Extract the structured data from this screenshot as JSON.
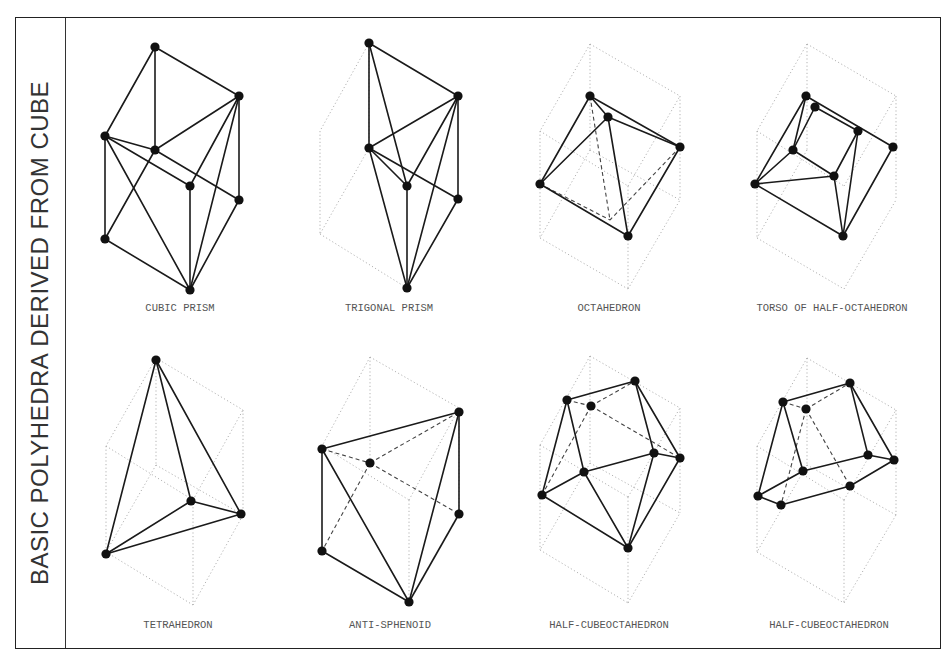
{
  "title": "BASIC POLYHEDRA DERIVED FROM CUBE",
  "colors": {
    "line": "#1a1a1a",
    "dotted": "#aaaaaa",
    "text": "#555555",
    "frame": "#222222"
  },
  "figures": [
    {
      "name": "cubic-prism",
      "label": "CUBIC PRISM",
      "label_pos": [
        180,
        311
      ],
      "cube": [],
      "solid": [
        [
          155,
          47,
          239,
          96
        ],
        [
          155,
          47,
          105,
          136
        ],
        [
          155,
          47,
          155,
          150
        ],
        [
          105,
          136,
          105,
          239
        ],
        [
          105,
          136,
          155,
          150
        ],
        [
          155,
          150,
          239,
          96
        ],
        [
          105,
          136,
          190,
          186
        ],
        [
          155,
          150,
          239,
          200
        ],
        [
          239,
          96,
          239,
          200
        ],
        [
          190,
          186,
          190,
          290
        ],
        [
          105,
          239,
          190,
          290
        ],
        [
          190,
          290,
          239,
          200
        ],
        [
          155,
          150,
          105,
          239
        ],
        [
          105,
          136,
          190,
          290
        ],
        [
          239,
          96,
          190,
          186
        ],
        [
          239,
          96,
          190,
          290
        ]
      ],
      "dashed": [],
      "dots": [
        [
          155,
          47
        ],
        [
          239,
          96
        ],
        [
          105,
          136
        ],
        [
          155,
          150
        ],
        [
          190,
          186
        ],
        [
          239,
          200
        ],
        [
          105,
          239
        ],
        [
          190,
          290
        ]
      ]
    },
    {
      "name": "trigonal-prism",
      "label": "TRIGONAL PRISM",
      "label_pos": [
        389,
        311
      ],
      "cube": [
        [
          369,
          43,
          320,
          131
        ],
        [
          320,
          131,
          320,
          234
        ],
        [
          320,
          234,
          407,
          288
        ],
        [
          369,
          43,
          369,
          148
        ],
        [
          369,
          148,
          320,
          234
        ]
      ],
      "solid": [
        [
          369,
          43,
          458,
          96
        ],
        [
          369,
          43,
          369,
          148
        ],
        [
          369,
          43,
          407,
          186
        ],
        [
          458,
          96,
          458,
          199
        ],
        [
          369,
          148,
          458,
          96
        ],
        [
          369,
          148,
          407,
          186
        ],
        [
          369,
          148,
          458,
          199
        ],
        [
          407,
          186,
          458,
          96
        ],
        [
          407,
          186,
          407,
          288
        ],
        [
          369,
          148,
          407,
          288
        ],
        [
          458,
          96,
          407,
          288
        ],
        [
          458,
          199,
          407,
          288
        ]
      ],
      "dashed": [],
      "dots": [
        [
          369,
          43
        ],
        [
          458,
          96
        ],
        [
          369,
          148
        ],
        [
          407,
          186
        ],
        [
          458,
          199
        ],
        [
          407,
          288
        ]
      ]
    },
    {
      "name": "octahedron",
      "label": "OCTAHEDRON",
      "label_pos": [
        609,
        311
      ],
      "cube": [
        [
          590,
          44,
          680,
          96
        ],
        [
          590,
          44,
          540,
          131
        ],
        [
          540,
          131,
          540,
          238
        ],
        [
          540,
          238,
          628,
          289
        ],
        [
          628,
          289,
          680,
          200
        ],
        [
          680,
          96,
          680,
          200
        ],
        [
          590,
          44,
          590,
          150
        ],
        [
          590,
          150,
          540,
          238
        ],
        [
          590,
          150,
          680,
          200
        ],
        [
          540,
          131,
          628,
          186
        ],
        [
          628,
          186,
          680,
          96
        ],
        [
          628,
          186,
          628,
          289
        ]
      ],
      "solid": [
        [
          590,
          96,
          608,
          117
        ],
        [
          590,
          96,
          680,
          147
        ],
        [
          590,
          96,
          540,
          184
        ],
        [
          608,
          117,
          680,
          147
        ],
        [
          608,
          117,
          540,
          184
        ],
        [
          608,
          117,
          628,
          236
        ],
        [
          540,
          184,
          628,
          236
        ],
        [
          680,
          147,
          628,
          236
        ]
      ],
      "dashed": [
        [
          590,
          96,
          610,
          220
        ],
        [
          540,
          184,
          610,
          220
        ],
        [
          680,
          147,
          610,
          220
        ]
      ],
      "dots": [
        [
          590,
          96
        ],
        [
          608,
          117
        ],
        [
          680,
          147
        ],
        [
          540,
          184
        ],
        [
          628,
          236
        ]
      ]
    },
    {
      "name": "torso-of-half-octahedron",
      "label": "TORSO OF HALF-OCTAHEDRON",
      "label_pos": [
        832,
        311
      ],
      "cube": [
        [
          807,
          44,
          896,
          96
        ],
        [
          807,
          44,
          757,
          131
        ],
        [
          757,
          131,
          757,
          238
        ],
        [
          757,
          238,
          844,
          289
        ],
        [
          844,
          289,
          896,
          200
        ],
        [
          896,
          96,
          896,
          200
        ],
        [
          807,
          44,
          807,
          150
        ],
        [
          807,
          150,
          757,
          238
        ],
        [
          757,
          131,
          844,
          186
        ],
        [
          844,
          186,
          896,
          96
        ]
      ],
      "solid": [
        [
          806,
          96,
          893,
          147
        ],
        [
          815,
          107,
          858,
          131
        ],
        [
          806,
          96,
          755,
          184
        ],
        [
          806,
          96,
          793,
          150
        ],
        [
          815,
          107,
          793,
          150
        ],
        [
          793,
          150,
          755,
          184
        ],
        [
          793,
          150,
          834,
          176
        ],
        [
          755,
          184,
          834,
          176
        ],
        [
          834,
          176,
          858,
          131
        ],
        [
          834,
          176,
          843,
          236
        ],
        [
          858,
          131,
          843,
          236
        ],
        [
          755,
          184,
          843,
          236
        ],
        [
          893,
          147,
          843,
          236
        ]
      ],
      "dashed": [],
      "dots": [
        [
          806,
          96
        ],
        [
          815,
          107
        ],
        [
          858,
          131
        ],
        [
          893,
          147
        ],
        [
          793,
          150
        ],
        [
          834,
          176
        ],
        [
          755,
          184
        ],
        [
          843,
          236
        ]
      ]
    },
    {
      "name": "tetrahedron",
      "label": "TETRAHEDRON",
      "label_pos": [
        178,
        628
      ],
      "cube": [
        [
          156,
          358,
          243,
          410
        ],
        [
          156,
          358,
          106,
          446
        ],
        [
          106,
          446,
          106,
          552
        ],
        [
          106,
          552,
          193,
          605
        ],
        [
          193,
          605,
          243,
          515
        ],
        [
          243,
          410,
          243,
          515
        ],
        [
          156,
          358,
          156,
          465
        ],
        [
          156,
          465,
          106,
          552
        ],
        [
          156,
          465,
          243,
          515
        ],
        [
          106,
          446,
          193,
          500
        ],
        [
          193,
          500,
          243,
          410
        ],
        [
          193,
          500,
          193,
          605
        ]
      ],
      "solid": [
        [
          156,
          360,
          106,
          554
        ],
        [
          156,
          360,
          191,
          501
        ],
        [
          156,
          360,
          241,
          514
        ],
        [
          106,
          554,
          191,
          501
        ],
        [
          106,
          554,
          241,
          514
        ],
        [
          191,
          501,
          241,
          514
        ]
      ],
      "dashed": [],
      "dots": [
        [
          156,
          360
        ],
        [
          191,
          501
        ],
        [
          241,
          514
        ],
        [
          106,
          554
        ]
      ]
    },
    {
      "name": "anti-sphenoid",
      "label": "ANTI-SPHENOID",
      "label_pos": [
        390,
        628
      ],
      "cube": [
        [
          370,
          357,
          459,
          408
        ],
        [
          370,
          357,
          322,
          446
        ],
        [
          370,
          357,
          370,
          463
        ],
        [
          459,
          408,
          459,
          515
        ],
        [
          322,
          446,
          409,
          500
        ],
        [
          409,
          500,
          409,
          603
        ],
        [
          409,
          500,
          459,
          408
        ]
      ],
      "solid": [
        [
          322,
          449,
          459,
          412
        ],
        [
          322,
          449,
          322,
          551
        ],
        [
          322,
          449,
          409,
          602
        ],
        [
          459,
          412,
          459,
          514
        ],
        [
          459,
          412,
          409,
          602
        ],
        [
          322,
          551,
          409,
          602
        ],
        [
          459,
          514,
          409,
          602
        ]
      ],
      "dashed": [
        [
          322,
          449,
          370,
          463
        ],
        [
          370,
          463,
          459,
          412
        ],
        [
          370,
          463,
          322,
          551
        ],
        [
          370,
          463,
          459,
          514
        ]
      ],
      "dots": [
        [
          459,
          412
        ],
        [
          322,
          449
        ],
        [
          370,
          463
        ],
        [
          459,
          514
        ],
        [
          322,
          551
        ],
        [
          409,
          602
        ]
      ]
    },
    {
      "name": "half-cubeoctahedron-1",
      "label": "HALF-CUBEOCTAHEDRON",
      "label_pos": [
        609,
        628
      ],
      "cube": [
        [
          590,
          356,
          680,
          408
        ],
        [
          590,
          356,
          540,
          445
        ],
        [
          540,
          445,
          540,
          550
        ],
        [
          540,
          550,
          628,
          603
        ],
        [
          628,
          603,
          680,
          513
        ],
        [
          680,
          408,
          680,
          513
        ],
        [
          590,
          356,
          590,
          463
        ],
        [
          590,
          463,
          540,
          550
        ],
        [
          590,
          463,
          680,
          513
        ],
        [
          540,
          445,
          628,
          497
        ],
        [
          628,
          497,
          680,
          408
        ],
        [
          628,
          497,
          628,
          603
        ]
      ],
      "solid": [
        [
          567,
          400,
          635,
          381
        ],
        [
          567,
          400,
          542,
          495
        ],
        [
          567,
          400,
          584,
          472
        ],
        [
          635,
          381,
          680,
          458
        ],
        [
          635,
          381,
          654,
          453
        ],
        [
          584,
          472,
          654,
          453
        ],
        [
          654,
          453,
          680,
          458
        ],
        [
          542,
          495,
          584,
          472
        ],
        [
          584,
          472,
          628,
          548
        ],
        [
          542,
          495,
          628,
          548
        ],
        [
          654,
          453,
          628,
          548
        ],
        [
          680,
          458,
          628,
          548
        ]
      ],
      "dashed": [
        [
          567,
          400,
          591,
          406
        ],
        [
          591,
          406,
          635,
          381
        ],
        [
          591,
          406,
          542,
          495
        ],
        [
          591,
          406,
          680,
          458
        ]
      ],
      "dots": [
        [
          635,
          381
        ],
        [
          567,
          400
        ],
        [
          591,
          406
        ],
        [
          654,
          453
        ],
        [
          680,
          458
        ],
        [
          584,
          472
        ],
        [
          542,
          495
        ],
        [
          628,
          548
        ]
      ]
    },
    {
      "name": "half-cubeoctahedron-2",
      "label": "HALF-CUBEOCTAHEDRON",
      "label_pos": [
        829,
        628
      ],
      "cube": [
        [
          807,
          358,
          896,
          410
        ],
        [
          807,
          358,
          757,
          446
        ],
        [
          757,
          446,
          757,
          552
        ],
        [
          757,
          552,
          844,
          603
        ],
        [
          844,
          603,
          896,
          515
        ],
        [
          896,
          410,
          896,
          515
        ],
        [
          807,
          358,
          807,
          465
        ],
        [
          807,
          465,
          757,
          552
        ],
        [
          807,
          465,
          896,
          515
        ],
        [
          757,
          446,
          844,
          500
        ],
        [
          844,
          500,
          896,
          410
        ],
        [
          844,
          500,
          844,
          603
        ]
      ],
      "solid": [
        [
          783,
          402,
          850,
          383
        ],
        [
          783,
          402,
          758,
          496
        ],
        [
          783,
          402,
          803,
          471
        ],
        [
          850,
          383,
          868,
          455
        ],
        [
          850,
          383,
          894,
          460
        ],
        [
          803,
          471,
          868,
          455
        ],
        [
          868,
          455,
          894,
          460
        ],
        [
          758,
          496,
          803,
          471
        ],
        [
          758,
          496,
          781,
          505
        ],
        [
          781,
          505,
          850,
          486
        ],
        [
          850,
          486,
          894,
          460
        ]
      ],
      "dashed": [
        [
          783,
          402,
          806,
          409
        ],
        [
          806,
          409,
          850,
          383
        ],
        [
          806,
          409,
          781,
          505
        ],
        [
          806,
          409,
          850,
          486
        ]
      ],
      "dots": [
        [
          850,
          383
        ],
        [
          783,
          402
        ],
        [
          806,
          409
        ],
        [
          868,
          455
        ],
        [
          894,
          460
        ],
        [
          803,
          471
        ],
        [
          850,
          486
        ],
        [
          758,
          496
        ],
        [
          781,
          505
        ]
      ]
    }
  ]
}
